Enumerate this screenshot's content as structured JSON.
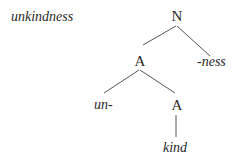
{
  "word": "unkindness",
  "tree": {
    "root": {
      "label": "N",
      "x": 177,
      "y": 9
    },
    "a1": {
      "label": "A",
      "x": 140,
      "y": 54
    },
    "ness": {
      "label": "-ness",
      "x": 197,
      "y": 54
    },
    "un": {
      "label": "un-",
      "x": 94,
      "y": 98
    },
    "a2": {
      "label": "A",
      "x": 177,
      "y": 98
    },
    "kind": {
      "label": "kind",
      "x": 163,
      "y": 140
    }
  },
  "edges": [
    {
      "from": "N",
      "to": "A"
    },
    {
      "from": "N",
      "to": "-ness"
    },
    {
      "from": "A",
      "to": "un-"
    },
    {
      "from": "A",
      "to": "A"
    },
    {
      "from": "A",
      "to": "kind"
    }
  ],
  "colors": {
    "line": "#555555",
    "text": "#2a2a2a"
  }
}
